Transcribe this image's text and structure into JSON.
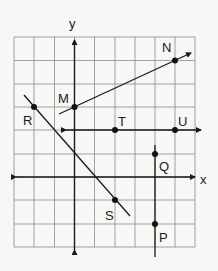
{
  "diagram": {
    "type": "coordinate-grid",
    "grid": {
      "columns": 9,
      "rows": 9,
      "x0": 14,
      "y0": 37,
      "x1": 195,
      "y1": 247
    },
    "axes": {
      "x_label": "x",
      "y_label": "y",
      "origin_px": [
        74.5,
        177
      ]
    },
    "points": [
      {
        "name": "M",
        "grid": [
          0,
          3
        ]
      },
      {
        "name": "N",
        "grid": [
          5,
          5
        ]
      },
      {
        "name": "R",
        "grid": [
          -2,
          3
        ]
      },
      {
        "name": "S",
        "grid": [
          2,
          -1
        ]
      },
      {
        "name": "T",
        "grid": [
          2,
          2
        ]
      },
      {
        "name": "U",
        "grid": [
          5,
          2
        ]
      },
      {
        "name": "Q",
        "grid": [
          4,
          1
        ]
      },
      {
        "name": "P",
        "grid": [
          4,
          -2
        ]
      }
    ],
    "lines": [
      {
        "name": "line-MN",
        "through": [
          "M",
          "N"
        ]
      },
      {
        "name": "line-RS",
        "through": [
          "R",
          "S"
        ]
      },
      {
        "name": "line-TU",
        "through": [
          "T",
          "U"
        ]
      },
      {
        "name": "line-QP",
        "through": [
          "Q",
          "P"
        ]
      }
    ],
    "labels": {
      "M": "M",
      "N": "N",
      "R": "R",
      "S": "S",
      "T": "T",
      "U": "U",
      "Q": "Q",
      "P": "P"
    }
  }
}
